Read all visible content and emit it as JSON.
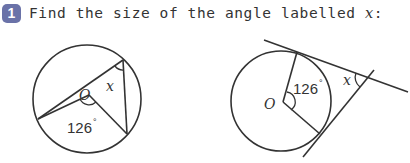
{
  "question": {
    "number": "1",
    "text": "Find the size of the angle labelled ",
    "variable": "x",
    "suffix": ":"
  },
  "figures": [
    {
      "id": "figure-a",
      "description": "Circle with centre O; inscribed triangle; angle at centre 126° subtending chord; find inscribed angle x",
      "center_label": "O",
      "given_angle": "126",
      "degree_symbol": "°",
      "unknown_label": "x"
    },
    {
      "id": "figure-b",
      "description": "Circle with centre O; two tangents meeting at external point; angle between radii 126°; find angle x between tangents",
      "center_label": "O",
      "given_angle": "126",
      "degree_symbol": "°",
      "unknown_label": "x"
    }
  ],
  "colors": {
    "badge": "#6a72a8",
    "ink": "#333333"
  }
}
